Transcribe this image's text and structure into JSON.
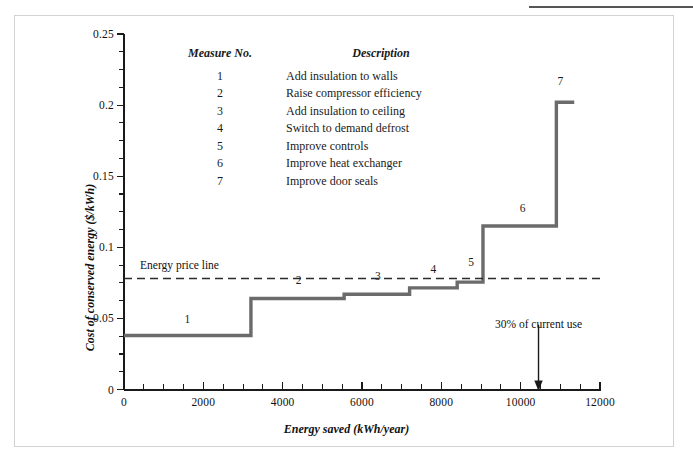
{
  "figure": {
    "border_color": "#d3d3d3",
    "curve_color": "#6b6b6b",
    "axis_color": "#1a1a1a"
  },
  "chart_data": {
    "type": "line",
    "title": "",
    "xlabel": "Energy saved (kWh/year)",
    "ylabel": "Cost of conserved energy ($/kWh)",
    "xlim": [
      0,
      12000
    ],
    "ylim": [
      0,
      0.25
    ],
    "grid": false,
    "xticks": [
      0,
      2000,
      4000,
      6000,
      8000,
      10000,
      12000
    ],
    "xticklabels": [
      "0",
      "2000",
      "4000",
      "6000",
      "8000",
      "10000",
      "12000"
    ],
    "xtick_minor_step": 500,
    "yticks": [
      0,
      0.05,
      0.1,
      0.15,
      0.2,
      0.25
    ],
    "yticklabels": [
      "0",
      "0.05",
      "0.1",
      "0.15",
      "0.2",
      "0.25"
    ],
    "ytick_minor_step": 0.0125,
    "series_name": "Cost of conserved energy supply curve",
    "steps": [
      {
        "measure": "1",
        "x_start": 0,
        "x_end": 3200,
        "cost": 0.038
      },
      {
        "measure": "2",
        "x_start": 3200,
        "x_end": 5550,
        "cost": 0.064
      },
      {
        "measure": "3",
        "x_start": 5550,
        "x_end": 7200,
        "cost": 0.067
      },
      {
        "measure": "4",
        "x_start": 7200,
        "x_end": 8400,
        "cost": 0.0715
      },
      {
        "measure": "5",
        "x_start": 8400,
        "x_end": 9050,
        "cost": 0.0755
      },
      {
        "measure": "6",
        "x_start": 9050,
        "x_end": 10900,
        "cost": 0.115
      },
      {
        "measure": "7",
        "x_start": 10900,
        "x_end": 11350,
        "cost": 0.202
      }
    ],
    "step_labels": [
      {
        "text": "1",
        "x": 1600,
        "y": 0.0485
      },
      {
        "text": "2",
        "x": 4400,
        "y": 0.0755
      },
      {
        "text": "3",
        "x": 6400,
        "y": 0.0785
      },
      {
        "text": "4",
        "x": 7800,
        "y": 0.0835
      },
      {
        "text": "5",
        "x": 8750,
        "y": 0.0885
      },
      {
        "text": "6",
        "x": 10050,
        "y": 0.1265
      },
      {
        "text": "7",
        "x": 11000,
        "y": 0.2155
      }
    ],
    "reference_line": {
      "label": "Energy price line",
      "value": 0.078,
      "style": "dashed",
      "x_start": 0,
      "x_end": 12000
    },
    "annotation": {
      "label": "30% of current use",
      "x": 10450,
      "arrow_from_y": 0.0455,
      "arrow_to_y": 0.0
    }
  },
  "legend": {
    "header_measure": "Measure No.",
    "header_description": "Description",
    "rows": [
      {
        "no": "1",
        "desc": "Add insulation to walls"
      },
      {
        "no": "2",
        "desc": "Raise compressor efficiency"
      },
      {
        "no": "3",
        "desc": "Add insulation to ceiling"
      },
      {
        "no": "4",
        "desc": "Switch to demand defrost"
      },
      {
        "no": "5",
        "desc": "Improve controls"
      },
      {
        "no": "6",
        "desc": "Improve heat exchanger"
      },
      {
        "no": "7",
        "desc": "Improve door seals"
      }
    ]
  }
}
